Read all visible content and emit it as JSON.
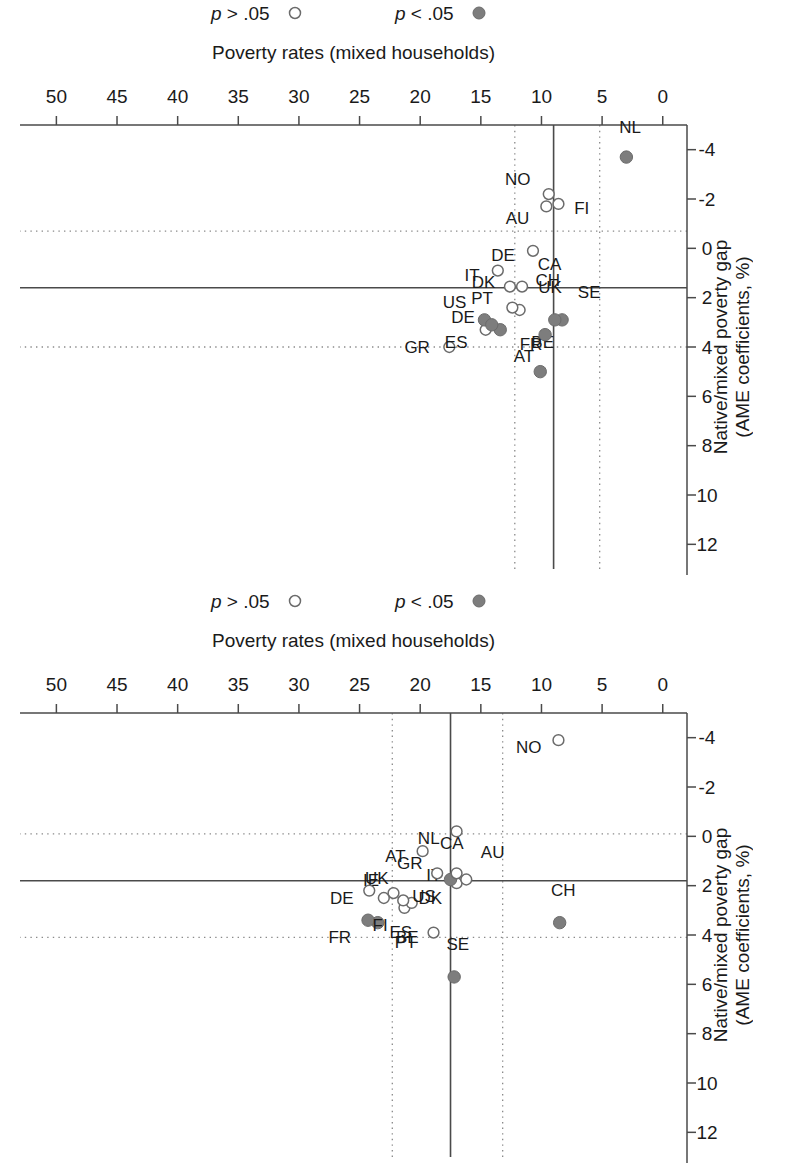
{
  "figure": {
    "panel_count": 2,
    "orientation_note": "rotated-180"
  },
  "axes": {
    "xlabel": "Poverty rates (mixed households)",
    "ylabel_line1": "Native/mixed poverty gap",
    "ylabel_line2": "(AME coefficients, %)",
    "xticks": [
      "0",
      "5",
      "10",
      "15",
      "20",
      "25",
      "30",
      "35",
      "40",
      "45",
      "50"
    ],
    "yticks": [
      "-4",
      "-2",
      "0",
      "2",
      "4",
      "6",
      "8",
      "10",
      "12"
    ],
    "xlim": [
      -2.0,
      53.0
    ],
    "ylim": [
      -5.0,
      13.0
    ]
  },
  "legend": {
    "items": [
      {
        "symbol": "filled-circle",
        "label_p": "p",
        "label_rest": "< .05"
      },
      {
        "symbol": "open-circle",
        "label_p": "p",
        "label_rest": "> .05"
      }
    ]
  },
  "chart_data": [
    {
      "type": "scatter",
      "panel": "top",
      "title": "",
      "xlabel": "Poverty rates (mixed households)",
      "ylabel": "Native/mixed poverty gap (AME coefficients, %)",
      "xlim": [
        -2.0,
        53.0
      ],
      "ylim": [
        -5.0,
        13.0
      ],
      "xticks": [
        0,
        5,
        10,
        15,
        20,
        25,
        30,
        35,
        40,
        45,
        50
      ],
      "yticks": [
        -4,
        -2,
        0,
        2,
        4,
        6,
        8,
        10,
        12
      ],
      "grid": "dotted reference lines at y=1.6 (solid), y=4.0 and y=-0.7 (dotted); x=9.0 (solid), x=12.2 and x=5.2 (dotted)",
      "reflines": {
        "x_solid": 9.0,
        "x_dotted": [
          5.2,
          12.2
        ],
        "y_solid": 1.6,
        "y_dotted": [
          -0.7,
          4.0
        ]
      },
      "legend_position": "below-right",
      "points": [
        {
          "label": "BE",
          "x": 10.1,
          "y": 5.0,
          "sig": "filled",
          "lab_dx": -0.2,
          "lab_dy": -1.2,
          "lab_anchor": "middle"
        },
        {
          "label": "GR",
          "x": 17.6,
          "y": 4.0,
          "sig": "open",
          "lab_dx": 1.6,
          "lab_dy": 0.0,
          "lab_anchor": "start"
        },
        {
          "label": "AT",
          "x": 9.7,
          "y": 3.5,
          "sig": "filled",
          "lab_dx": 0.9,
          "lab_dy": 0.9,
          "lab_anchor": "start"
        },
        {
          "label": "ES",
          "x": 14.6,
          "y": 3.3,
          "sig": "open",
          "lab_dx": 1.5,
          "lab_dy": 0.5,
          "lab_anchor": "start"
        },
        {
          "label": "FR",
          "x": 13.4,
          "y": 3.3,
          "sig": "filled",
          "lab_dx": -1.6,
          "lab_dy": 0.6,
          "lab_anchor": "end"
        },
        {
          "label": "US",
          "x": 14.7,
          "y": 2.9,
          "sig": "filled",
          "lab_dx": 1.5,
          "lab_dy": -0.7,
          "lab_anchor": "start"
        },
        {
          "label": "SE",
          "x": 8.3,
          "y": 2.9,
          "sig": "filled",
          "lab_dx": -1.3,
          "lab_dy": -1.1,
          "lab_anchor": "end"
        },
        {
          "label": "UK",
          "x": 8.9,
          "y": 2.9,
          "sig": "filled",
          "lab_dx": 0.4,
          "lab_dy": -1.3,
          "lab_anchor": "middle"
        },
        {
          "label": "DE",
          "x": 14.1,
          "y": 3.1,
          "sig": "filled",
          "lab_dx": 1.4,
          "lab_dy": -0.3,
          "lab_anchor": "start"
        },
        {
          "label": "CH",
          "x": 11.8,
          "y": 2.5,
          "sig": "open",
          "lab_dx": -1.3,
          "lab_dy": -1.2,
          "lab_anchor": "end"
        },
        {
          "label": "DK",
          "x": 12.4,
          "y": 2.4,
          "sig": "open",
          "lab_dx": 1.4,
          "lab_dy": -1.0,
          "lab_anchor": "start"
        },
        {
          "label": "CA",
          "x": 11.6,
          "y": 1.55,
          "sig": "open",
          "lab_dx": -1.3,
          "lab_dy": -0.9,
          "lab_anchor": "end"
        },
        {
          "label": "PT",
          "x": 12.6,
          "y": 1.55,
          "sig": "open",
          "lab_dx": 1.4,
          "lab_dy": 0.5,
          "lab_anchor": "start"
        },
        {
          "label": "IT",
          "x": 13.6,
          "y": 0.9,
          "sig": "open",
          "lab_dx": 1.5,
          "lab_dy": 0.2,
          "lab_anchor": "start"
        },
        {
          "label": "DE2",
          "x": 10.7,
          "y": 0.1,
          "sig": "open",
          "lab_dx": 1.5,
          "lab_dy": 0.2,
          "lab_anchor": "start",
          "display": "DE"
        },
        {
          "label": "AU",
          "x": 9.6,
          "y": -1.7,
          "sig": "open",
          "lab_dx": 1.4,
          "lab_dy": 0.5,
          "lab_anchor": "start"
        },
        {
          "label": "FI",
          "x": 8.6,
          "y": -1.8,
          "sig": "open",
          "lab_dx": -1.3,
          "lab_dy": 0.2,
          "lab_anchor": "end"
        },
        {
          "label": "NO",
          "x": 9.4,
          "y": -2.2,
          "sig": "open",
          "lab_dx": 1.5,
          "lab_dy": -0.6,
          "lab_anchor": "start"
        },
        {
          "label": "NL",
          "x": 3.0,
          "y": -3.7,
          "sig": "filled",
          "lab_dx": -0.3,
          "lab_dy": -1.2,
          "lab_anchor": "middle"
        }
      ]
    },
    {
      "type": "scatter",
      "panel": "bottom",
      "title": "",
      "xlabel": "Poverty rates (mixed households)",
      "ylabel": "Native/mixed poverty gap (AME coefficients, %)",
      "xlim": [
        -2.0,
        53.0
      ],
      "ylim": [
        -5.0,
        13.0
      ],
      "xticks": [
        0,
        5,
        10,
        15,
        20,
        25,
        30,
        35,
        40,
        45,
        50
      ],
      "yticks": [
        -4,
        -2,
        0,
        2,
        4,
        6,
        8,
        10,
        12
      ],
      "grid": "dotted reference lines; solid reference lines at x=17.5 and y=1.8",
      "reflines": {
        "x_solid": 17.5,
        "x_dotted": [
          13.2,
          22.3
        ],
        "y_solid": 1.8,
        "y_dotted": [
          -0.1,
          4.1
        ]
      },
      "legend_position": "below-right",
      "points": [
        {
          "label": "SE",
          "x": 17.2,
          "y": 5.7,
          "sig": "filled",
          "lab_dx": -0.3,
          "lab_dy": -1.3,
          "lab_anchor": "middle"
        },
        {
          "label": "CH",
          "x": 8.5,
          "y": 3.5,
          "sig": "filled",
          "lab_dx": -0.3,
          "lab_dy": -1.3,
          "lab_anchor": "middle"
        },
        {
          "label": "BE",
          "x": 23.5,
          "y": 3.5,
          "sig": "filled",
          "lab_dx": -1.5,
          "lab_dy": 0.6,
          "lab_anchor": "end"
        },
        {
          "label": "FR",
          "x": 24.3,
          "y": 3.4,
          "sig": "filled",
          "lab_dx": 1.4,
          "lab_dy": 0.7,
          "lab_anchor": "start"
        },
        {
          "label": "PT",
          "x": 18.9,
          "y": 3.9,
          "sig": "open",
          "lab_dx": 1.4,
          "lab_dy": 0.4,
          "lab_anchor": "start"
        },
        {
          "label": "ES",
          "x": 21.3,
          "y": 2.9,
          "sig": "open",
          "lab_dx": 0.3,
          "lab_dy": 1.0,
          "lab_anchor": "middle"
        },
        {
          "label": "IT",
          "x": 20.7,
          "y": 2.7,
          "sig": "open",
          "lab_dx": -1.2,
          "lab_dy": -1.1,
          "lab_anchor": "end"
        },
        {
          "label": "UK",
          "x": 21.4,
          "y": 2.6,
          "sig": "open",
          "lab_dx": 1.2,
          "lab_dy": -0.9,
          "lab_anchor": "start"
        },
        {
          "label": "IE",
          "x": 22.2,
          "y": 2.3,
          "sig": "open",
          "lab_dx": 1.2,
          "lab_dy": -0.5,
          "lab_anchor": "start"
        },
        {
          "label": "FI",
          "x": 23.0,
          "y": 2.5,
          "sig": "open",
          "lab_dx": 0.3,
          "lab_dy": 1.1,
          "lab_anchor": "middle"
        },
        {
          "label": "DK",
          "x": 17.0,
          "y": 1.9,
          "sig": "open",
          "lab_dx": 1.2,
          "lab_dy": 0.6,
          "lab_anchor": "start"
        },
        {
          "label": "DE",
          "x": 24.2,
          "y": 2.2,
          "sig": "open",
          "lab_dx": 1.3,
          "lab_dy": 0.3,
          "lab_anchor": "start"
        },
        {
          "label": "AU",
          "x": 16.2,
          "y": 1.75,
          "sig": "open",
          "lab_dx": -1.2,
          "lab_dy": -1.1,
          "lab_anchor": "end"
        },
        {
          "label": "US",
          "x": 17.5,
          "y": 1.75,
          "sig": "filled",
          "lab_dx": 1.2,
          "lab_dy": 0.7,
          "lab_anchor": "start"
        },
        {
          "label": "CA",
          "x": 17.0,
          "y": 1.5,
          "sig": "open",
          "lab_dx": 0.4,
          "lab_dy": -1.2,
          "lab_anchor": "middle"
        },
        {
          "label": "GR",
          "x": 18.6,
          "y": 1.5,
          "sig": "open",
          "lab_dx": 1.2,
          "lab_dy": -0.4,
          "lab_anchor": "start"
        },
        {
          "label": "AT",
          "x": 19.8,
          "y": 0.6,
          "sig": "open",
          "lab_dx": 1.4,
          "lab_dy": 0.2,
          "lab_anchor": "start"
        },
        {
          "label": "NL",
          "x": 17.0,
          "y": -0.2,
          "sig": "open",
          "lab_dx": 1.4,
          "lab_dy": 0.3,
          "lab_anchor": "start"
        },
        {
          "label": "NO",
          "x": 8.6,
          "y": -3.9,
          "sig": "open",
          "lab_dx": 1.4,
          "lab_dy": 0.3,
          "lab_anchor": "start"
        }
      ]
    }
  ]
}
